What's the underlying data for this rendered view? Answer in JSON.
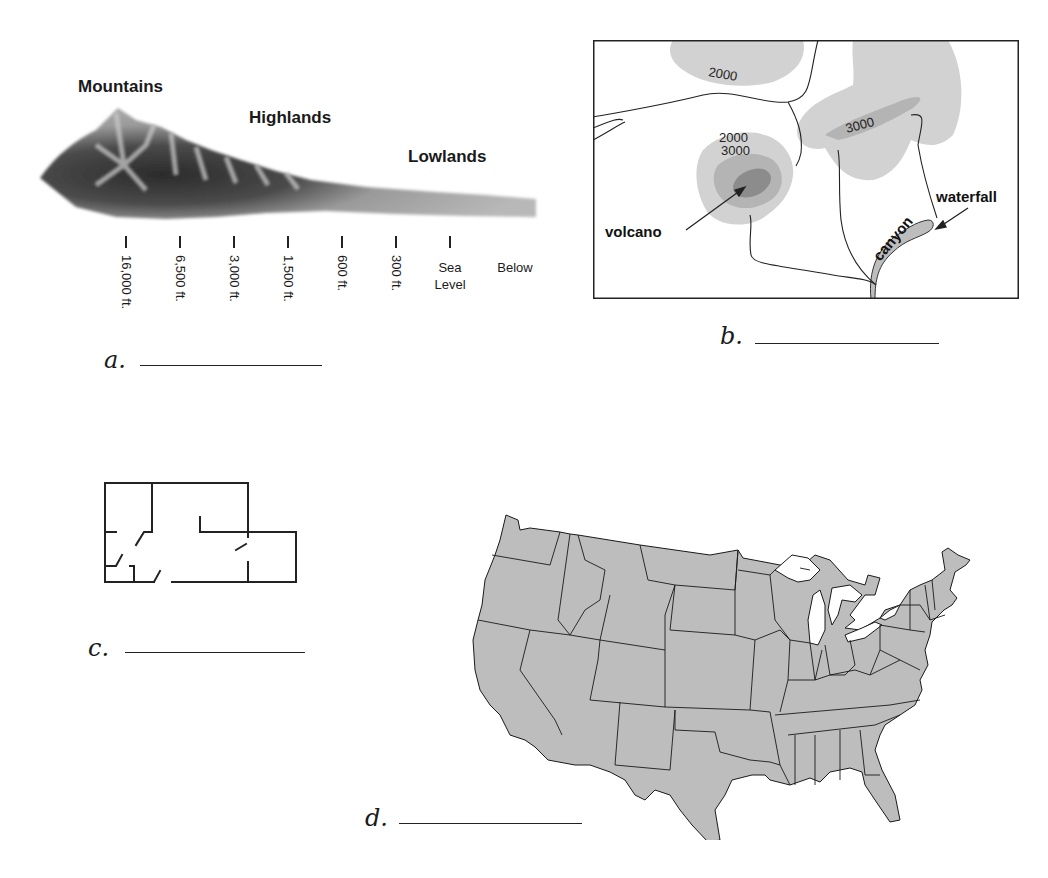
{
  "figure_a": {
    "letter": "a.",
    "regions": [
      {
        "label": "Mountains"
      },
      {
        "label": "Highlands"
      },
      {
        "label": "Lowlands"
      }
    ],
    "elevations": [
      "16,000 ft.",
      "6,500 ft.",
      "3,000 ft.",
      "1,500 ft.",
      "600 ft.",
      "300 ft."
    ],
    "sea_level": {
      "line1": "Sea",
      "line2": "Level"
    },
    "below": "Below"
  },
  "figure_b": {
    "letter": "b.",
    "contours": {
      "top": "2000",
      "left_upper": "2000",
      "left_lower": "3000",
      "right": "3000"
    },
    "labels": {
      "volcano": "volcano",
      "waterfall": "waterfall",
      "canyon": "canyon"
    }
  },
  "figure_c": {
    "letter": "c."
  },
  "figure_d": {
    "letter": "d."
  },
  "colors": {
    "map_fill": "#bdbdbd",
    "contour_light": "#d2d2d2",
    "contour_mid": "#b4b4b4",
    "contour_dark": "#8c8c8c",
    "ink": "#222222"
  }
}
